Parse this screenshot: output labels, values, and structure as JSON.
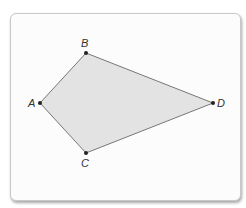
{
  "heading": {
    "fragment": ""
  },
  "figure": {
    "shape": "kite",
    "fill_color": "#e3e3e3",
    "stroke_color": "#777777",
    "point_color": "#222222",
    "vertices": [
      {
        "label": "A",
        "x": 40,
        "y": 103
      },
      {
        "label": "B",
        "x": 86,
        "y": 53
      },
      {
        "label": "D",
        "x": 213,
        "y": 103
      },
      {
        "label": "C",
        "x": 86,
        "y": 153
      }
    ],
    "labels": {
      "A": "A",
      "B": "B",
      "C": "C",
      "D": "D"
    }
  }
}
